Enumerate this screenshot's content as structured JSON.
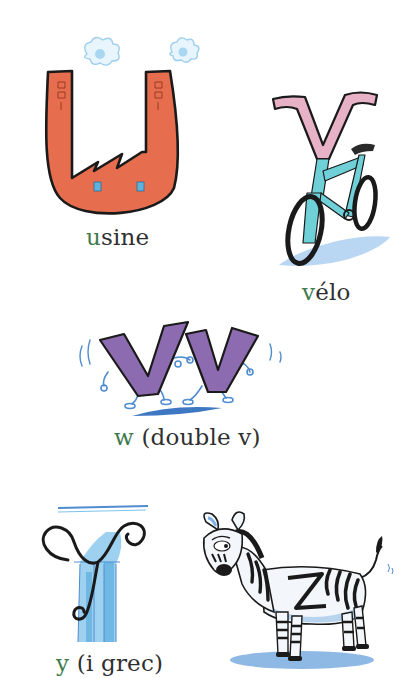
{
  "page": {
    "background": "#ffffff",
    "accent_letter_color": "#3e7a4e",
    "text_color": "#2f2f2f"
  },
  "entries": [
    {
      "letter": "u",
      "lead": "u",
      "rest": "sine",
      "word": "usine",
      "illustration": "factory-shaped-letter-u-icon",
      "colors": {
        "body": "#e66e4f",
        "outline": "#1a1a1a",
        "window": "#5fb2dd",
        "smoke": "#a9d7f2"
      }
    },
    {
      "letter": "v",
      "lead": "v",
      "rest": "élo",
      "word": "vélo",
      "illustration": "bicycle-with-letter-v-handlebars-icon",
      "colors": {
        "handlebar": "#e7b2c5",
        "frame": "#6fd0d8",
        "wheel": "#1a1a1a",
        "shadow": "#7fb6e6"
      }
    },
    {
      "letter": "w",
      "lead": "w",
      "rest": " (double v)",
      "word": "w (double v)",
      "illustration": "two-dancing-letter-v-icon",
      "colors": {
        "letters": "#8d6bb0",
        "limbs": "#4f8cd0",
        "shadow": "#3f78c2"
      }
    },
    {
      "letter": "y",
      "lead": "y",
      "rest": " (i grec)",
      "word": "y (i grec)",
      "illustration": "ionic-column-letter-y-icon",
      "colors": {
        "column": "#7ec3ea",
        "scroll": "#1a1a1a"
      }
    },
    {
      "letter": "z",
      "lead": "",
      "rest": "",
      "word": "",
      "illustration": "zebra-with-letter-z-icon",
      "colors": {
        "body": "#f3f7fb",
        "stripes": "#1a1a1a",
        "shading": "#b7d3ee",
        "shadow": "#6aa2dc"
      }
    }
  ]
}
